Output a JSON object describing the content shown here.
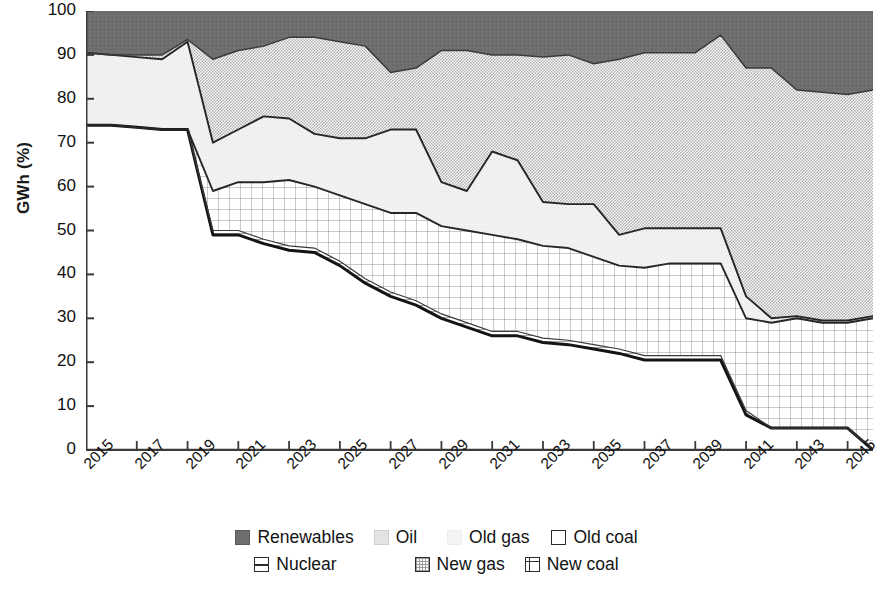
{
  "axes": {
    "y_title": "GWh (%)",
    "y_ticks": [
      "100",
      "90",
      "80",
      "70",
      "60",
      "50",
      "40",
      "30",
      "20",
      "10",
      "0"
    ],
    "x_ticks": [
      "2015",
      "2017",
      "2019",
      "2021",
      "2023",
      "2025",
      "2027",
      "2029",
      "2031",
      "2033",
      "2035",
      "2037",
      "2039",
      "2041",
      "2043",
      "2045"
    ]
  },
  "legend": {
    "row1": [
      {
        "label": "Renewables",
        "pattern": "solid-dark",
        "color": "#6b6b6b"
      },
      {
        "label": "Oil",
        "pattern": "fine-dots",
        "color": "#d9d9d9"
      },
      {
        "label": "Old gas",
        "pattern": "light-stipple",
        "color": "#f0f0f0"
      },
      {
        "label": "Old coal",
        "pattern": "empty",
        "color": "#ffffff"
      }
    ],
    "row2": [
      {
        "label": "Nuclear",
        "pattern": "horizontal-lines",
        "color": "#ffffff"
      },
      {
        "label": "New gas",
        "pattern": "cross-hatch",
        "color": "#e2e2e2"
      },
      {
        "label": "New coal",
        "pattern": "grid",
        "color": "#ffffff"
      }
    ]
  },
  "chart_data": {
    "type": "area",
    "title": "",
    "xlabel": "",
    "ylabel": "GWh (%)",
    "ylim": [
      0,
      100
    ],
    "xlim": [
      2015,
      2046
    ],
    "grid": false,
    "legend_position": "bottom",
    "stacked": true,
    "stack_order_bottom_to_top": [
      "Old coal",
      "Nuclear",
      "New coal",
      "Old gas",
      "Oil",
      "New gas",
      "Renewables"
    ],
    "x": [
      2015,
      2016,
      2017,
      2018,
      2019,
      2020,
      2021,
      2022,
      2023,
      2024,
      2025,
      2026,
      2027,
      2028,
      2029,
      2030,
      2031,
      2032,
      2033,
      2034,
      2035,
      2036,
      2037,
      2038,
      2039,
      2040,
      2041,
      2042,
      2043,
      2044,
      2045,
      2046
    ],
    "series": [
      {
        "name": "Old coal",
        "values": [
          74,
          74,
          73.5,
          73,
          73,
          49,
          49,
          47,
          45.5,
          45,
          42,
          38,
          35,
          33,
          30,
          28,
          26,
          26,
          24.5,
          24,
          23,
          22,
          20.5,
          20.5,
          20.5,
          20.5,
          8,
          5,
          5,
          5,
          5,
          0
        ]
      },
      {
        "name": "Nuclear",
        "values": [
          0,
          0,
          0,
          0,
          0,
          1,
          1,
          1,
          1,
          1,
          1,
          1,
          1,
          1,
          1,
          1,
          1,
          1,
          1,
          1,
          1,
          1,
          1,
          1,
          1,
          1,
          1,
          0,
          0,
          0,
          0,
          0
        ]
      },
      {
        "name": "New coal",
        "values": [
          0,
          0,
          0,
          0,
          0,
          9,
          11,
          13,
          15,
          14,
          15,
          17,
          18,
          20,
          20,
          21,
          22,
          21,
          21,
          21,
          20,
          19,
          20,
          21,
          21,
          21,
          21,
          24,
          25,
          24,
          24,
          30
        ]
      },
      {
        "name": "Old gas",
        "values": [
          16.5,
          16,
          16,
          16,
          20,
          11,
          12,
          15,
          14,
          12,
          13,
          15,
          19,
          19,
          10,
          9,
          19,
          18,
          10,
          10,
          12,
          7,
          9,
          8,
          8,
          8,
          5,
          1,
          0.5,
          0.5,
          0.5,
          0.5
        ]
      },
      {
        "name": "Oil",
        "values": [
          0,
          0,
          0,
          0,
          0,
          0,
          0,
          0,
          0,
          0,
          0,
          0,
          0,
          0,
          0,
          0,
          0,
          0,
          0,
          0,
          0,
          0,
          0,
          0,
          0,
          0,
          0,
          0,
          0,
          0,
          0,
          0
        ]
      },
      {
        "name": "New gas",
        "values": [
          0,
          0,
          0.5,
          1,
          0.5,
          19,
          18,
          16,
          18.5,
          22,
          22,
          21,
          13,
          14,
          30,
          32,
          22,
          24,
          33,
          34,
          32,
          40,
          40,
          40,
          40,
          44,
          52,
          57,
          51.5,
          52,
          51.5,
          51.5
        ]
      },
      {
        "name": "Renewables",
        "values": [
          9.5,
          10,
          10,
          10,
          6.5,
          11,
          9,
          8,
          6,
          6,
          7,
          8,
          14,
          13,
          9,
          9,
          10,
          10,
          10.5,
          10,
          12,
          11,
          9.5,
          9.5,
          9.5,
          5.5,
          13,
          13,
          18,
          18.5,
          19,
          18
        ]
      }
    ],
    "boundary_lines_top_of_stack": {
      "old_coal": [
        74,
        74,
        73.5,
        73,
        73,
        49,
        49,
        47,
        45.5,
        45,
        42,
        38,
        35,
        33,
        30,
        28,
        26,
        26,
        24.5,
        24,
        23,
        22,
        20.5,
        20.5,
        20.5,
        20.5,
        8,
        5,
        5,
        5,
        5,
        0
      ],
      "nuclear": [
        74,
        74,
        73.5,
        73,
        73,
        50,
        50,
        48,
        46.5,
        46,
        43,
        39,
        36,
        34,
        31,
        29,
        27,
        27,
        25.5,
        25,
        24,
        23,
        21.5,
        21.5,
        21.5,
        21.5,
        9,
        5,
        5,
        5,
        5,
        0
      ],
      "new_coal": [
        74,
        74,
        73.5,
        73,
        73,
        59,
        61,
        61,
        61.5,
        60,
        58,
        56,
        54,
        54,
        51,
        50,
        49,
        48,
        46.5,
        46,
        44,
        42,
        41.5,
        42.5,
        42.5,
        42.5,
        30,
        29,
        30,
        29,
        29,
        30
      ],
      "old_gas": [
        90.5,
        90,
        89.5,
        89,
        93,
        70,
        73,
        76,
        75.5,
        72,
        71,
        71,
        73,
        73,
        61,
        59,
        68,
        66,
        56.5,
        56,
        56,
        49,
        50.5,
        50.5,
        50.5,
        50.5,
        35,
        30,
        30.5,
        29.5,
        29.5,
        30.5
      ],
      "new_gas": [
        90.5,
        90,
        90,
        90,
        93.5,
        89,
        91,
        92,
        94,
        94,
        93,
        92,
        86,
        87,
        91,
        91,
        90,
        90,
        89.5,
        90,
        88,
        89,
        90.5,
        90.5,
        90.5,
        94.5,
        87,
        87,
        82,
        81.5,
        81,
        82
      ]
    }
  }
}
